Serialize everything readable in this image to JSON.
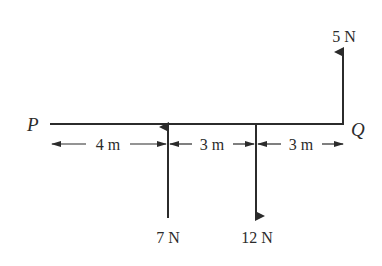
{
  "diagram": {
    "beam": {
      "left_label": "P",
      "right_label": "Q",
      "total_length_m": 10
    },
    "forces": [
      {
        "id": "force-5n",
        "label": "5 N",
        "magnitude_N": 5,
        "direction": "up",
        "position_from_P_m": 10
      },
      {
        "id": "force-7n",
        "label": "7 N",
        "magnitude_N": 7,
        "direction": "up",
        "position_from_P_m": 4
      },
      {
        "id": "force-12n",
        "label": "12 N",
        "magnitude_N": 12,
        "direction": "down",
        "position_from_P_m": 7
      }
    ],
    "dimensions": [
      {
        "label": "4 m",
        "from_m": 0,
        "to_m": 4
      },
      {
        "label": "3 m",
        "from_m": 4,
        "to_m": 7
      },
      {
        "label": "3 m",
        "from_m": 7,
        "to_m": 10
      }
    ],
    "colors": {
      "ink": "#2b2b2b",
      "background": "#ffffff"
    }
  }
}
